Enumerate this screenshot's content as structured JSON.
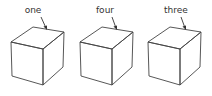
{
  "figure": {
    "cubes": [
      {
        "label": "one",
        "offset_x": 0
      },
      {
        "label": "four",
        "offset_x": 69
      },
      {
        "label": "three",
        "offset_x": 137
      }
    ],
    "colors": {
      "stroke": "#444444",
      "text": "#333333",
      "background": "#ffffff"
    }
  }
}
